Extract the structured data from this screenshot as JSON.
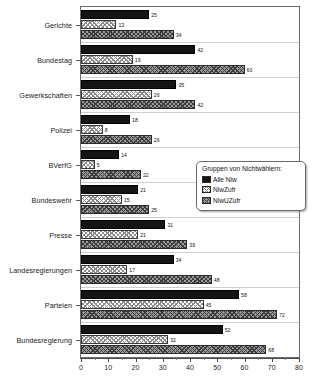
{
  "chart_data": {
    "type": "bar",
    "orientation": "horizontal",
    "title": "",
    "xlabel": "",
    "ylabel": "",
    "xlim": [
      0,
      80
    ],
    "xticks": [
      0,
      10,
      20,
      30,
      40,
      50,
      60,
      70,
      80
    ],
    "xtick_labels": [
      "0",
      "10",
      "20",
      "30",
      "40",
      "50",
      "60",
      "70",
      "80"
    ],
    "grid": false,
    "legend_position": "center-right",
    "legend_title": "Gruppen von Nichtwählern:",
    "categories": [
      "Gerichte",
      "Bundestag",
      "Gewerkschaften",
      "Polizei",
      "BVerfG",
      "Bundeswehr",
      "Presse",
      "Landesregierungen",
      "Parteien",
      "Bundesregierung"
    ],
    "series": [
      {
        "name": "Alle Niw",
        "fill": "solid-black",
        "values": [
          25,
          42,
          35,
          18,
          14,
          21,
          31,
          34,
          58,
          52
        ]
      },
      {
        "name": "NiwZufr",
        "fill": "light-crosshatch",
        "values": [
          13,
          19,
          26,
          8,
          5,
          15,
          21,
          17,
          45,
          32
        ]
      },
      {
        "name": "NiwUZufr",
        "fill": "dark-crosshatch",
        "values": [
          34,
          60,
          42,
          26,
          22,
          25,
          39,
          48,
          72,
          68
        ]
      }
    ]
  },
  "legend": {
    "title": "Gruppen von Nichtwählern:",
    "items": [
      {
        "label": "Alle Niw"
      },
      {
        "label": "NiwZufr"
      },
      {
        "label": "NiwUZufr"
      }
    ]
  },
  "colors": {
    "series_1": "#141414",
    "series_2": "#ffffff",
    "series_3": "#9a9a9a",
    "axis": "#4a4a4a",
    "frame": "#6d6d6d",
    "text": "#1a1a1a"
  }
}
